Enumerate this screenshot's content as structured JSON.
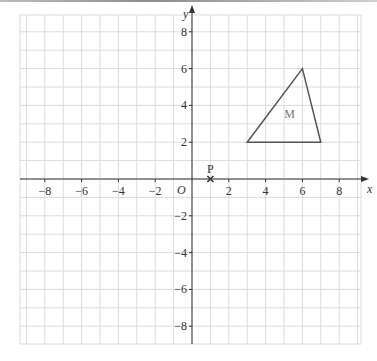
{
  "diagram": {
    "type": "coordinate-grid",
    "x_axis_label": "x",
    "y_axis_label": "y",
    "origin_label": "O",
    "x_ticks": [
      {
        "value": -8,
        "label": "−8"
      },
      {
        "value": -6,
        "label": "−6"
      },
      {
        "value": -4,
        "label": "−4"
      },
      {
        "value": -2,
        "label": "−2"
      },
      {
        "value": 2,
        "label": "2"
      },
      {
        "value": 4,
        "label": "4"
      },
      {
        "value": 6,
        "label": "6"
      },
      {
        "value": 8,
        "label": "8"
      }
    ],
    "y_ticks": [
      {
        "value": 8,
        "label": "8"
      },
      {
        "value": 6,
        "label": "6"
      },
      {
        "value": 4,
        "label": "4"
      },
      {
        "value": 2,
        "label": "2"
      },
      {
        "value": -2,
        "label": "−2"
      },
      {
        "value": -4,
        "label": "−4"
      },
      {
        "value": -6,
        "label": "−6"
      },
      {
        "value": -8,
        "label": "−8"
      }
    ],
    "shapes": [
      {
        "name": "M",
        "label": "M",
        "vertices": [
          [
            3,
            2
          ],
          [
            6,
            6
          ],
          [
            7,
            2
          ]
        ],
        "label_pos": [
          5.3,
          3.3
        ]
      }
    ],
    "points": [
      {
        "name": "P",
        "label": "P",
        "x": 1,
        "y": 0,
        "marker": "cross"
      }
    ],
    "colors": {
      "grid": "#dcdcdc",
      "axis": "#333333",
      "shape": "#555555",
      "label": "#333333",
      "shape_label": "#777777"
    }
  }
}
